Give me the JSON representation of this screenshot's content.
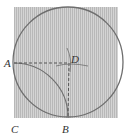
{
  "diagram": {
    "type": "geometry",
    "shapes": [
      "square",
      "inscribed circle",
      "quarter arc centered at C",
      "dashed segments AD and DB",
      "construction arcs at D"
    ],
    "colors": {
      "fill": "#c8c8c8",
      "stroke": "#6e6e6e",
      "background": "#ffffff"
    },
    "points": {
      "A": {
        "label": "A"
      },
      "B": {
        "label": "B"
      },
      "C": {
        "label": "C"
      },
      "D": {
        "label": "D"
      }
    }
  }
}
